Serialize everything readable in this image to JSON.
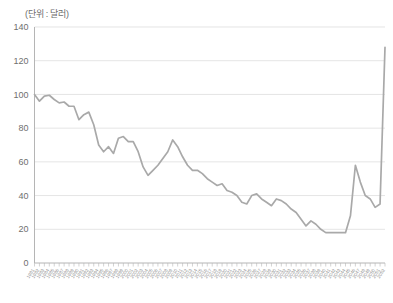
{
  "chart_data": {
    "type": "line",
    "title": "",
    "subtitle": "",
    "unit_label": "(단위 : 달러)",
    "xlabel": "",
    "ylabel": "",
    "ylim": [
      0,
      140
    ],
    "ytick_labels": [
      "0",
      "20",
      "40",
      "60",
      "80",
      "100",
      "120",
      "140"
    ],
    "ytick_values": [
      0,
      20,
      40,
      60,
      80,
      100,
      120,
      140
    ],
    "grid": true,
    "legend": "none",
    "series": [
      {
        "name": "price",
        "color": "#a9a9a9",
        "x": [
          "1981",
          "1982",
          "1983",
          "1984",
          "1985",
          "1986",
          "1987",
          "1988",
          "1989",
          "1990",
          "1991",
          "1992",
          "1993",
          "1994",
          "1995",
          "1996",
          "1997",
          "1998",
          "1999",
          "2000",
          "2001",
          "2002",
          "2003",
          "2004",
          "2005",
          "2006",
          "2007",
          "2008",
          "2009",
          "2010",
          "2011",
          "2012",
          "2013",
          "2014",
          "2015",
          "2016",
          "2017",
          "2018",
          "2019",
          "2020",
          "2021",
          "2022",
          "2023",
          "2024",
          "2025",
          "2026",
          "2027",
          "2028",
          "2029",
          "2030",
          "2031",
          "2032",
          "2033",
          "2034",
          "2035",
          "2036",
          "2037",
          "2038",
          "2039",
          "2040",
          "2041",
          "2042",
          "2043",
          "2044",
          "2045",
          "2046",
          "2047",
          "2048",
          "2049",
          "2050",
          "2051",
          "2052"
        ],
        "x_tick_labels": [
          "1981",
          "1982",
          "1983",
          "1984",
          "1985",
          "1986",
          "1987",
          "1988",
          "1989",
          "1990",
          "1991",
          "1992",
          "1993",
          "1994",
          "1995",
          "1996",
          "1997",
          "1998",
          "1999",
          "2000",
          "2001",
          "2002",
          "2003",
          "2004",
          "2005",
          "2006",
          "2007",
          "2008",
          "2009",
          "2010",
          "2011",
          "2012",
          "2013",
          "2014",
          "2015",
          "2016",
          "2017",
          "2018",
          "2019",
          "2020",
          "2021",
          "2022",
          "2023",
          "2024",
          "2025",
          "2026",
          "2027",
          "2028",
          "2029",
          "2030",
          "2031",
          "2032",
          "2033",
          "2034",
          "2035",
          "2036",
          "2037",
          "2038",
          "2039",
          "2040",
          "2041",
          "2042",
          "2043",
          "2044",
          "2045",
          "2046",
          "2047",
          "2048",
          "2049",
          "2050",
          "2051",
          "2052"
        ],
        "values": [
          100,
          96,
          99,
          99.5,
          97,
          95,
          95.5,
          93,
          93,
          85,
          88,
          89.5,
          82,
          70,
          66,
          69,
          65,
          74,
          75,
          72,
          72,
          66,
          57,
          52,
          55,
          58,
          62,
          66,
          73,
          69,
          63,
          58,
          55,
          55,
          53,
          50,
          48,
          46,
          47,
          43,
          42,
          40,
          36,
          35,
          40,
          41,
          38,
          36,
          34,
          38,
          37,
          35,
          32,
          30,
          26,
          22,
          25,
          23,
          20,
          18,
          18,
          18,
          18,
          18,
          28,
          58,
          48,
          40,
          38,
          33,
          35,
          128
        ]
      }
    ]
  }
}
